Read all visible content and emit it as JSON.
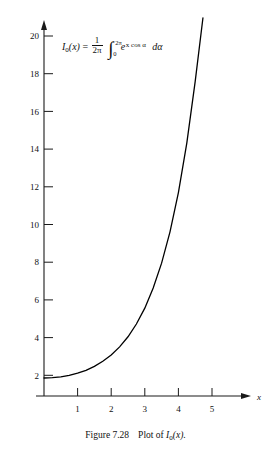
{
  "figure": {
    "caption_label": "Figure 7.28",
    "caption_text": "Plot of",
    "caption_function": "I",
    "caption_function_sub": "0",
    "caption_function_arg": "(x)",
    "caption_period": "."
  },
  "formula": {
    "lhs_symbol": "I",
    "lhs_sub": "0",
    "lhs_arg": "(x)",
    "equals": "=",
    "frac_num": "1",
    "frac_den": "2π",
    "integral_glyph": "∫",
    "limit_upper": "2π",
    "limit_lower": "0",
    "exp_base": "e",
    "exp_power": "x cos α",
    "differential": "dα",
    "plain": "I0(x) = (1/2π) ∫0^{2π} e^{x cos α} dα"
  },
  "axes": {
    "x_label": "x",
    "x_ticks": [
      "1",
      "2",
      "3",
      "4",
      "5"
    ],
    "x_tick_values": [
      1,
      2,
      3,
      4,
      5
    ],
    "y_ticks": [
      "2",
      "4",
      "6",
      "8",
      "10",
      "12",
      "14",
      "16",
      "18",
      "20"
    ],
    "y_tick_values": [
      2,
      4,
      6,
      8,
      10,
      12,
      14,
      16,
      18,
      20
    ],
    "x_range": [
      0,
      5.6
    ],
    "y_range": [
      0,
      21
    ],
    "axis_color": "#1a1a1a",
    "curve_color": "#000000"
  },
  "chart_data": {
    "type": "line",
    "title": "",
    "subtitle": "",
    "xlabel": "x",
    "ylabel": "",
    "xlim": [
      0,
      5.6
    ],
    "ylim": [
      0,
      21
    ],
    "grid": false,
    "legend": "none",
    "annotations": [
      "I0(x) = (1/2π) ∫0^{2π} e^{x cos α} dα"
    ],
    "series": [
      {
        "name": "I0(x)",
        "x": [
          0,
          0.25,
          0.5,
          0.75,
          1.0,
          1.25,
          1.5,
          1.75,
          2.0,
          2.25,
          2.5,
          2.75,
          3.0,
          3.25,
          3.5,
          3.75,
          4.0,
          4.25,
          4.5,
          4.73
        ],
        "y": [
          1.0,
          1.016,
          1.063,
          1.146,
          1.266,
          1.429,
          1.647,
          1.932,
          2.28,
          2.73,
          3.29,
          4.0,
          4.88,
          6.0,
          7.38,
          9.12,
          11.3,
          14.05,
          17.48,
          21.0
        ]
      }
    ]
  }
}
